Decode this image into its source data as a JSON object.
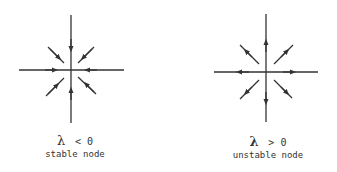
{
  "panels": [
    {
      "id": "stable",
      "lambda_symbol": "λ",
      "condition": "< 0",
      "caption": "stable node",
      "direction": "inward"
    },
    {
      "id": "unstable",
      "lambda_symbol": "λ",
      "condition": "> 0",
      "caption": "unstable node",
      "direction": "outward"
    }
  ],
  "colors": {
    "line": "#333333",
    "text": "#333333",
    "background": "#ffffff"
  }
}
